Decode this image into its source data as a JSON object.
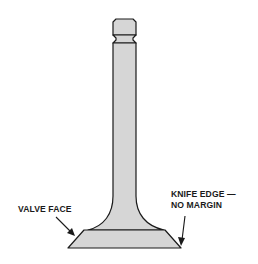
{
  "diagram": {
    "labels": {
      "valve_face": "VALVE FACE",
      "knife_edge_line1": "KNIFE EDGE —",
      "knife_edge_line2": "NO MARGIN"
    },
    "colors": {
      "valve_fill": "#d6d6d6",
      "outline": "#1a1a1a",
      "background": "#ffffff"
    }
  }
}
